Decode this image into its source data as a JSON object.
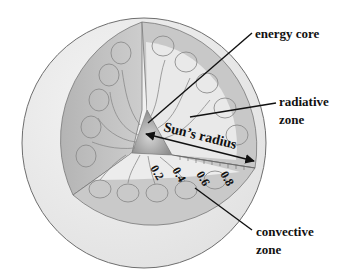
{
  "diagram": {
    "labels": {
      "energy_core": "energy core",
      "radiative_line1": "radiative",
      "radiative_line2": "zone",
      "convective_line1": "convective",
      "convective_line2": "zone",
      "suns_radius": "Sun’s radius"
    },
    "scale_ticks": [
      "0.2",
      "0.4",
      "0.6",
      "0.8"
    ],
    "colors": {
      "background": "#ffffff",
      "sphere_surface": "#ececec",
      "sphere_outline": "#6e6e6e",
      "left_face": "#bdbdbd",
      "right_face_inner": "#e8e8e8",
      "convective_band": "#c6c6c6",
      "core": "#9a9a9a",
      "text": "#111111"
    }
  }
}
